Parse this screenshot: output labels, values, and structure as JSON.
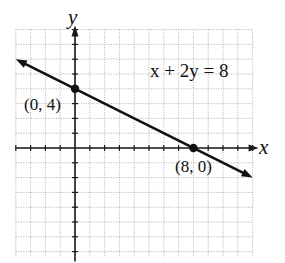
{
  "chart_data": {
    "type": "line",
    "title": "",
    "equation": "x + 2y = 8",
    "xlabel": "x",
    "ylabel": "y",
    "xlim": [
      -4,
      12
    ],
    "ylim": [
      -7.4,
      8
    ],
    "grid": true,
    "grid_style": "dotted",
    "series": [
      {
        "name": "x + 2y = 8",
        "x": [
          -4,
          0,
          8,
          12
        ],
        "y": [
          6,
          4,
          0,
          -2
        ]
      }
    ],
    "points": [
      {
        "x": 0,
        "y": 4,
        "label": "(0, 4)"
      },
      {
        "x": 8,
        "y": 0,
        "label": "(8, 0)"
      }
    ],
    "annotations": [
      "x + 2y = 8",
      "(0, 4)",
      "(8, 0)"
    ]
  },
  "labels": {
    "x_axis": "x",
    "y_axis": "y",
    "equation": "x + 2y = 8",
    "point_a": "(0, 4)",
    "point_b": "(8, 0)"
  }
}
